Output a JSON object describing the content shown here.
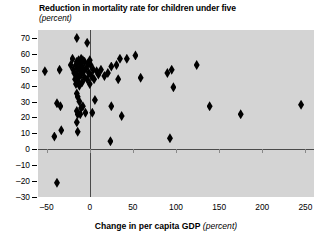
{
  "chart_data": {
    "type": "scatter",
    "title": "Reduction in mortality rate for children under five",
    "subtitle": "(percent)",
    "xlabel_bold": "Change in per capita GDP",
    "xlabel_italic": "(percent)",
    "ylabel": "",
    "xlim": [
      -60,
      260
    ],
    "ylim": [
      -30,
      75
    ],
    "xticks": [
      -50,
      0,
      50,
      100,
      150,
      200,
      250
    ],
    "xtick_labels": [
      "–50",
      "0",
      "50",
      "100",
      "150",
      "200",
      "250"
    ],
    "yticks": [
      70,
      60,
      50,
      40,
      30,
      20,
      10,
      0,
      -10,
      -20,
      -30
    ],
    "ytick_labels": [
      "70",
      "60",
      "50",
      "40",
      "30",
      "20",
      "10",
      "0",
      "–10",
      "–20",
      "–30"
    ],
    "grid": false,
    "legend": null,
    "zero_lines": {
      "horizontal_y": 0,
      "vertical_x": 0
    },
    "marker_shape": "diamond",
    "marker_color": "#000000",
    "plot_background": "#d4d4d4",
    "points": [
      [
        -52,
        49
      ],
      [
        -41,
        8
      ],
      [
        -38,
        29
      ],
      [
        -38,
        -21
      ],
      [
        -35,
        50
      ],
      [
        -34,
        27
      ],
      [
        -33,
        12
      ],
      [
        -22,
        53
      ],
      [
        -20,
        57
      ],
      [
        -19,
        50
      ],
      [
        -18,
        48
      ],
      [
        -17,
        44
      ],
      [
        -16,
        53
      ],
      [
        -16,
        41
      ],
      [
        -15,
        70
      ],
      [
        -15,
        55
      ],
      [
        -15,
        47
      ],
      [
        -15,
        35
      ],
      [
        -15,
        24
      ],
      [
        -15,
        17
      ],
      [
        -14,
        51
      ],
      [
        -14,
        43
      ],
      [
        -14,
        33
      ],
      [
        -14,
        22
      ],
      [
        -14,
        11
      ],
      [
        -13,
        56
      ],
      [
        -13,
        45
      ],
      [
        -12,
        50
      ],
      [
        -12,
        40
      ],
      [
        -12,
        30
      ],
      [
        -11,
        54
      ],
      [
        -11,
        22
      ],
      [
        -10,
        57
      ],
      [
        -10,
        47
      ],
      [
        -10,
        26
      ],
      [
        -9,
        52
      ],
      [
        -9,
        42
      ],
      [
        -8,
        56
      ],
      [
        -8,
        27
      ],
      [
        -7,
        49
      ],
      [
        -6,
        55
      ],
      [
        -6,
        45
      ],
      [
        -5,
        23
      ],
      [
        -4,
        51
      ],
      [
        -3,
        67
      ],
      [
        -3,
        44
      ],
      [
        -2,
        54
      ],
      [
        -1,
        48
      ],
      [
        0,
        56
      ],
      [
        0,
        41
      ],
      [
        1,
        53
      ],
      [
        2,
        46
      ],
      [
        3,
        23
      ],
      [
        4,
        50
      ],
      [
        5,
        44
      ],
      [
        6,
        31
      ],
      [
        8,
        49
      ],
      [
        10,
        47
      ],
      [
        13,
        50
      ],
      [
        17,
        46
      ],
      [
        21,
        48
      ],
      [
        24,
        5
      ],
      [
        25,
        52
      ],
      [
        25,
        27
      ],
      [
        31,
        53
      ],
      [
        33,
        44
      ],
      [
        35,
        57
      ],
      [
        37,
        21
      ],
      [
        43,
        57
      ],
      [
        53,
        59
      ],
      [
        59,
        45
      ],
      [
        90,
        48
      ],
      [
        93,
        7
      ],
      [
        95,
        50
      ],
      [
        97,
        39
      ],
      [
        124,
        53
      ],
      [
        139,
        27
      ],
      [
        175,
        22
      ],
      [
        245,
        28
      ]
    ]
  }
}
